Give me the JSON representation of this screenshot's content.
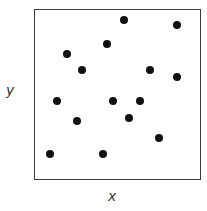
{
  "chart_data": {
    "type": "scatter",
    "title": "",
    "xlabel": "x",
    "ylabel": "y",
    "xlim": [
      0,
      1
    ],
    "ylim": [
      0,
      1
    ],
    "grid": false,
    "legend": null,
    "series": [
      {
        "name": "points",
        "color": "#111111",
        "points": [
          {
            "x": 0.53,
            "y": 0.94
          },
          {
            "x": 0.85,
            "y": 0.91
          },
          {
            "x": 0.43,
            "y": 0.8
          },
          {
            "x": 0.19,
            "y": 0.74
          },
          {
            "x": 0.28,
            "y": 0.65
          },
          {
            "x": 0.69,
            "y": 0.65
          },
          {
            "x": 0.85,
            "y": 0.61
          },
          {
            "x": 0.13,
            "y": 0.47
          },
          {
            "x": 0.47,
            "y": 0.47
          },
          {
            "x": 0.63,
            "y": 0.47
          },
          {
            "x": 0.56,
            "y": 0.37
          },
          {
            "x": 0.25,
            "y": 0.35
          },
          {
            "x": 0.74,
            "y": 0.25
          },
          {
            "x": 0.09,
            "y": 0.16
          },
          {
            "x": 0.41,
            "y": 0.16
          }
        ]
      }
    ]
  }
}
